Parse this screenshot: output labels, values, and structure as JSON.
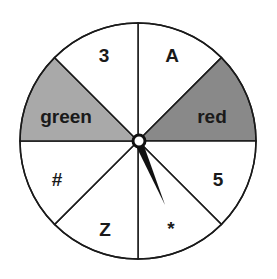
{
  "spinner": {
    "center": [
      138,
      141
    ],
    "radius": 118,
    "colors": {
      "white": "#ffffff",
      "light_gray": "#a9a9a9",
      "dark_gray": "#898989",
      "line": "#1a1a1a"
    },
    "sectors": [
      {
        "label": "A",
        "fill": "#ffffff"
      },
      {
        "label": "red",
        "fill": "#898989"
      },
      {
        "label": "5",
        "fill": "#ffffff"
      },
      {
        "label": "*",
        "fill": "#ffffff"
      },
      {
        "label": "Z",
        "fill": "#ffffff"
      },
      {
        "label": "#",
        "fill": "#ffffff"
      },
      {
        "label": "green",
        "fill": "#a9a9a9"
      },
      {
        "label": "3",
        "fill": "#ffffff"
      }
    ],
    "pointer": {
      "tip": [
        164,
        205
      ]
    }
  }
}
